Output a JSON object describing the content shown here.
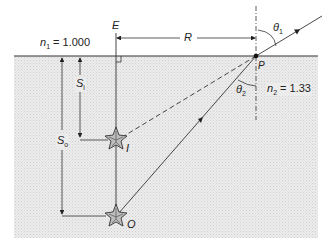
{
  "diagram": {
    "title": "",
    "media": {
      "upper": {
        "symbol": "n",
        "subscript": "1",
        "value": "= 1.000"
      },
      "lower": {
        "symbol": "n",
        "subscript": "2",
        "value": "= 1.33"
      }
    },
    "points": {
      "E": "E",
      "P": "P",
      "I": "I",
      "O": "O"
    },
    "distances": {
      "R": "R",
      "S_i": {
        "symbol": "S",
        "subscript": "i"
      },
      "S_o": {
        "symbol": "S",
        "subscript": "o"
      }
    },
    "angles": {
      "theta1": {
        "symbol": "θ",
        "subscript": "1"
      },
      "theta2": {
        "symbol": "θ",
        "subscript": "2"
      }
    },
    "colors": {
      "water": "#e6e6e6",
      "line": "#222222",
      "background": "#ffffff"
    }
  }
}
